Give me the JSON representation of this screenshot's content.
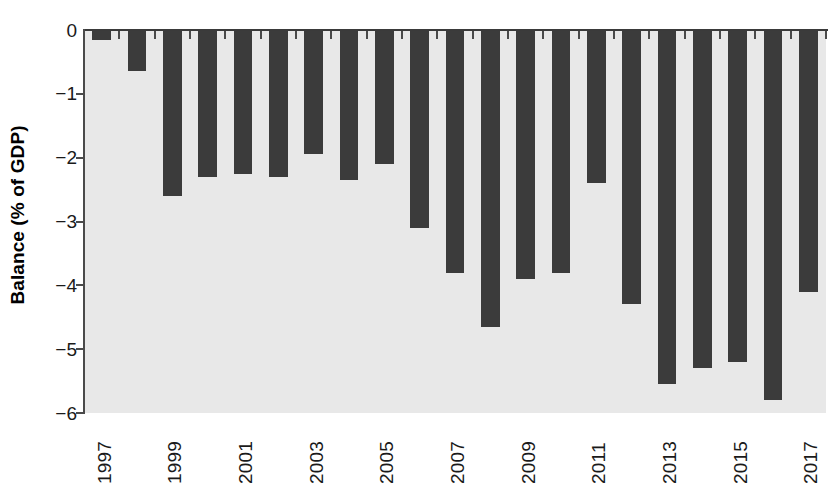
{
  "chart_data": {
    "type": "bar",
    "title": "",
    "subtitle": "",
    "xlabel": "",
    "ylabel": "Balance (% of GDP)",
    "categories": [
      "1997",
      "1998",
      "1999",
      "2000",
      "2001",
      "2002",
      "2003",
      "2004",
      "2005",
      "2006",
      "2007",
      "2008",
      "2009",
      "2010",
      "2011",
      "2012",
      "2013",
      "2014",
      "2015",
      "2016",
      "2017"
    ],
    "values": [
      -0.15,
      -0.65,
      -2.6,
      -2.3,
      -2.25,
      -2.3,
      -1.95,
      -2.35,
      -2.1,
      -3.1,
      -3.8,
      -4.65,
      -3.9,
      -3.8,
      -2.4,
      -4.3,
      -5.55,
      -5.3,
      -5.2,
      -5.8,
      -4.1
    ],
    "ylim": [
      -6,
      0
    ],
    "yticks": [
      0,
      -1,
      -2,
      -3,
      -4,
      -5,
      -6
    ],
    "ytick_labels": [
      "0",
      "−1",
      "−2",
      "−3",
      "−4",
      "−5",
      "−6"
    ],
    "xtick_labels": [
      "1997",
      "1999",
      "2001",
      "2003",
      "2005",
      "2007",
      "2009",
      "2011",
      "2013",
      "2015",
      "2017"
    ],
    "xtick_label_rotation": 90,
    "grid": false,
    "legend": null,
    "legend_position": "none",
    "bar_color": "#3b3b3b",
    "plot_background_color": "#e8e8e8",
    "axis_color": "#4a4a4a",
    "text_color": "#1a1a1a",
    "page_background_color": "#ffffff"
  }
}
